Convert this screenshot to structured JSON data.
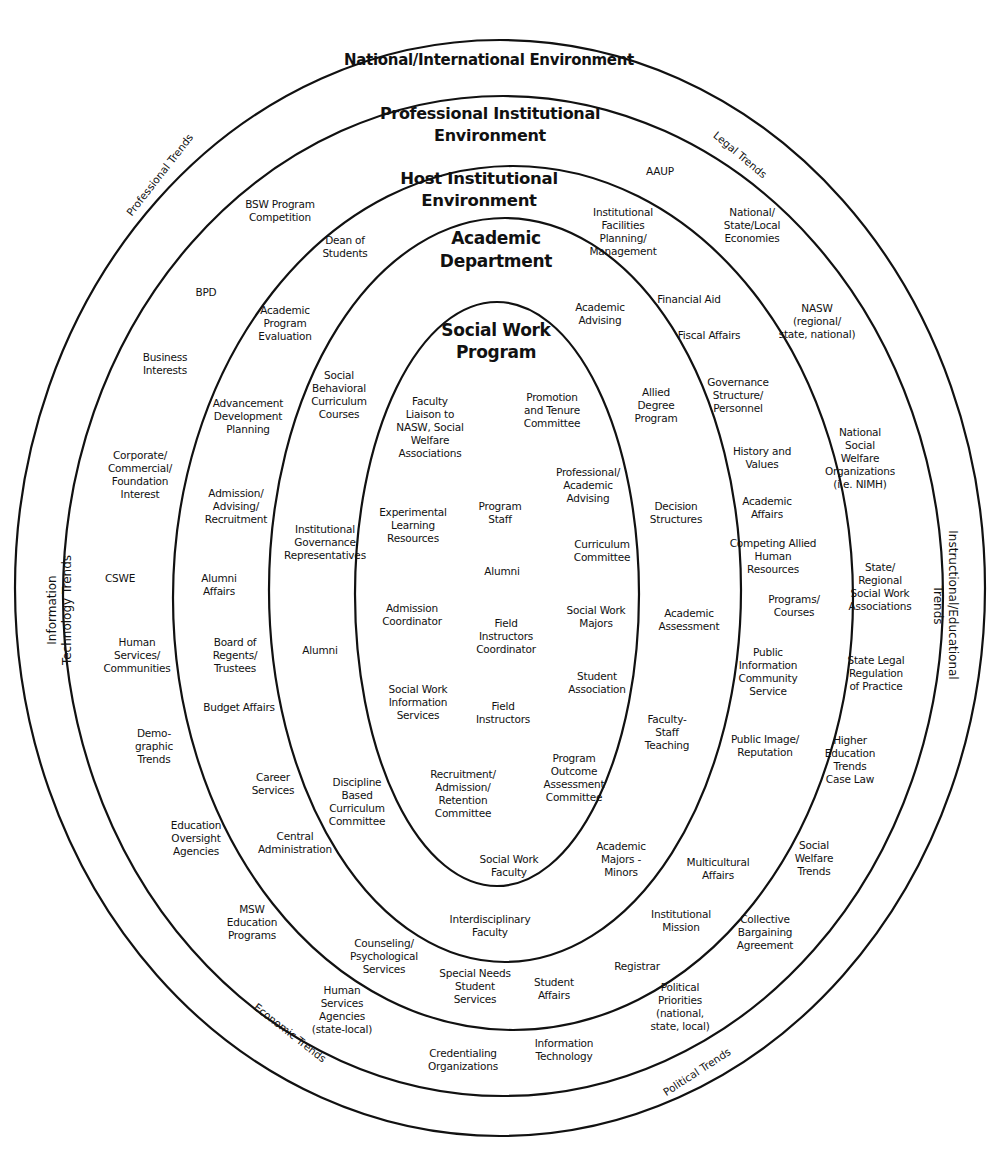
{
  "diagram": {
    "type": "nested-ellipses",
    "rings": [
      {
        "id": "national",
        "title": "National/International Environment"
      },
      {
        "id": "professional",
        "title": "Professional Institutional\nEnvironment"
      },
      {
        "id": "host",
        "title": "Host Institutional\nEnvironment"
      },
      {
        "id": "academic",
        "title": "Academic\nDepartment"
      },
      {
        "id": "program",
        "title": "Social Work\nProgram"
      }
    ],
    "trends": {
      "professional": "Professional Trends",
      "legal": "Legal Trends",
      "information_technology": "Information\nTechnology Trends",
      "instructional": "Instructional/Educational\nTrends",
      "economic": "Economic Trends",
      "political": "Political Trends"
    },
    "professional_ring_items": [
      "BSW Program\nCompetition",
      "BPD",
      "Business\nInterests",
      "Corporate/\nCommercial/\nFoundation\nInterest",
      "CSWE",
      "Human\nServices/\nCommunities",
      "Demo-\ngraphic\nTrends",
      "Education\nOversight\nAgencies",
      "MSW\nEducation\nPrograms",
      "Human\nServices\nAgencies\n(state-local)",
      "Credentialing\nOrganizations",
      "Information\nTechnology",
      "Political\nPriorities\n(national,\nstate, local)",
      "Collective\nBargaining\nAgreement",
      "Social\nWelfare\nTrends",
      "Higher\nEducation\nTrends\nCase Law",
      "State Legal\nRegulation\nof Practice",
      "State/\nRegional\nSocial Work\nAssociations",
      "National\nSocial\nWelfare\nOrganizations\n(i.e. NIMH)",
      "NASW\n(regional/\nstate, national)",
      "National/\nState/Local\nEconomies",
      "AAUP"
    ],
    "host_ring_items": [
      "Dean of\nStudents",
      "Academic\nProgram\nEvaluation",
      "Advancement\nDevelopment\nPlanning",
      "Admission/\nAdvising/\nRecruitment",
      "Alumni\nAffairs",
      "Board of\nRegents/\nTrustees",
      "Budget Affairs",
      "Career\nServices",
      "Central\nAdministration",
      "Counseling/\nPsychological\nServices",
      "Special Needs\nStudent\nServices",
      "Student\nAffairs",
      "Registrar",
      "Institutional\nMission",
      "Multicultural\nAffairs",
      "Public Image/\nReputation",
      "Public\nInformation\nCommunity\nService",
      "Programs/\nCourses",
      "Competing Allied\nHuman\nResources",
      "Academic\nAffairs",
      "History and\nValues",
      "Governance\nStructure/\nPersonnel",
      "Fiscal Affairs",
      "Financial Aid",
      "Institutional\nFacilities\nPlanning/\nManagement"
    ],
    "academic_ring_items": [
      "Social\nBehavioral\nCurriculum\nCourses",
      "Institutional\nGovernance\nRepresentatives",
      "Alumni",
      "Discipline\nBased\nCurriculum\nCommittee",
      "Interdisciplinary\nFaculty",
      "Academic\nMajors -\nMinors",
      "Faculty-\nStaff\nTeaching",
      "Academic\nAssessment",
      "Decision\nStructures",
      "Allied\nDegree\nProgram",
      "Academic\nAdvising"
    ],
    "program_items": [
      "Faculty\nLiaison to\nNASW, Social\nWelfare\nAssociations",
      "Promotion\nand Tenure\nCommittee",
      "Professional/\nAcademic\nAdvising",
      "Experimental\nLearning\nResources",
      "Program\nStaff",
      "Curriculum\nCommittee",
      "Alumni",
      "Admission\nCoordinator",
      "Field\nInstructors\nCoordinator",
      "Social Work\nMajors",
      "Student\nAssociation",
      "Social Work\nInformation\nServices",
      "Field\nInstructors",
      "Program\nOutcome\nAssessment\nCommittee",
      "Recruitment/\nAdmission/\nRetention\nCommittee",
      "Social Work\nFaculty"
    ],
    "colors": {
      "line": "#111111",
      "background": "#ffffff",
      "text": "#111111"
    }
  }
}
